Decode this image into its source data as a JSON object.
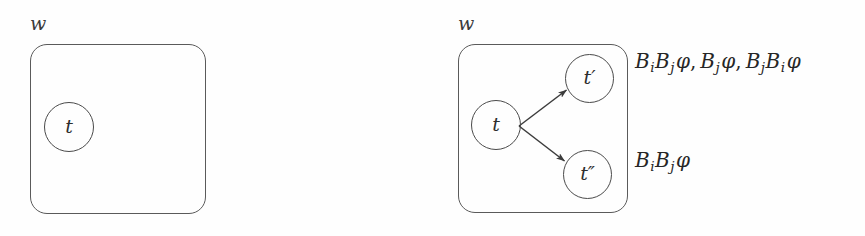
{
  "figure": {
    "type": "modal-logic-diagram",
    "background_color": "#fefefe",
    "stroke_color": "#4a4a4a"
  },
  "panels": [
    {
      "id": "left",
      "world_label": "w",
      "nodes": [
        {
          "id": "t",
          "label": "t"
        }
      ],
      "edges": [],
      "annotations": []
    },
    {
      "id": "right",
      "world_label": "w",
      "nodes": [
        {
          "id": "t",
          "label": "t"
        },
        {
          "id": "t-prime",
          "label": "t′"
        },
        {
          "id": "t-double-prime",
          "label": "t″"
        }
      ],
      "edges": [
        {
          "from": "t",
          "to": "t-prime"
        },
        {
          "from": "t",
          "to": "t-double-prime"
        }
      ],
      "annotations": [
        {
          "id": "annotation-top",
          "target": "t-prime",
          "text": "BᵢBⱼφ, Bⱼφ, BⱼBᵢφ",
          "terms": [
            {
              "operators": [
                "B_i",
                "B_j"
              ],
              "formula": "φ"
            },
            {
              "operators": [
                "B_j"
              ],
              "formula": "φ"
            },
            {
              "operators": [
                "B_j",
                "B_i"
              ],
              "formula": "φ"
            }
          ]
        },
        {
          "id": "annotation-bottom",
          "target": "t-double-prime",
          "text": "BᵢBⱼφ",
          "terms": [
            {
              "operators": [
                "B_i",
                "B_j"
              ],
              "formula": "φ"
            }
          ]
        }
      ]
    }
  ],
  "symbols": {
    "B": "B",
    "i": "i",
    "j": "j",
    "phi": "φ",
    "comma": ",",
    "t": "t",
    "t_prime": "t′",
    "t_double_prime": "t″",
    "w": "w"
  }
}
